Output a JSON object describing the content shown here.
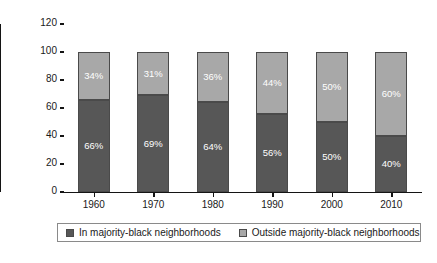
{
  "chart_data": {
    "type": "bar",
    "subtype": "stacked-100-percent",
    "title": "",
    "xlabel": "",
    "ylabel": "Percentage",
    "ylim": [
      0,
      120
    ],
    "yticks": [
      0,
      20,
      40,
      60,
      80,
      100,
      120
    ],
    "grid": false,
    "legend_position": "bottom",
    "categories": [
      "1960",
      "1970",
      "1980",
      "1990",
      "2000",
      "2010"
    ],
    "series": [
      {
        "name": "In majority-black neighborhoods",
        "color": "#575757",
        "values": [
          66,
          69,
          64,
          56,
          50,
          40
        ],
        "labels": [
          "66%",
          "69%",
          "64%",
          "56%",
          "50%",
          "40%"
        ]
      },
      {
        "name": "Outside majority-black neighborhoods",
        "color": "#a8a8a8",
        "values": [
          34,
          31,
          36,
          44,
          50,
          60
        ],
        "labels": [
          "34%",
          "31%",
          "36%",
          "44%",
          "50%",
          "60%"
        ]
      }
    ]
  },
  "axis": {
    "y_title": "Percentage",
    "y_tick_labels": [
      "0",
      "20",
      "40",
      "60",
      "80",
      "100",
      "120"
    ],
    "x_tick_labels": [
      "1960",
      "1970",
      "1980",
      "1990",
      "2000",
      "2010"
    ]
  },
  "legend": {
    "items": [
      {
        "label": "In majority-black neighborhoods",
        "swatch": "#575757"
      },
      {
        "label": "Outside majority-black neighborhoods",
        "swatch": "#a8a8a8"
      }
    ]
  },
  "colors": {
    "lower_segment": "#575757",
    "upper_segment": "#a8a8a8",
    "axis": "#141414",
    "label_text": "#ffffff",
    "background": "#ffffff"
  }
}
